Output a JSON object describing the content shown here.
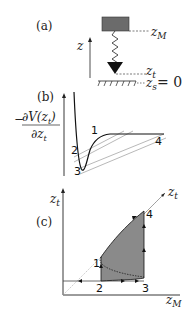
{
  "panel_a": {
    "label": "(a)",
    "axis_label": "z",
    "z_M": "z",
    "z_M_sub": "M",
    "z_t": "z",
    "z_t_sub": "t",
    "z_s": "z",
    "z_s_sub": "s",
    "z_s_eq": "= 0",
    "colors": {
      "cantilever": "#6b6b6b",
      "tip": "#111111"
    }
  },
  "panel_b": {
    "label": "(b)",
    "ylabel_num": "∂V(z",
    "ylabel_num_sub": "t",
    "ylabel_num_end": ")",
    "ylabel_den": "∂z",
    "ylabel_den_sub": "t",
    "ylabel_sign": "−",
    "points": [
      "1",
      "2",
      "3",
      "4"
    ]
  },
  "panel_c": {
    "label": "(c)",
    "y_axis": "z",
    "y_axis_sub": "t",
    "diag_label": "z",
    "diag_label_sub": "t",
    "x_axis": "z",
    "x_axis_sub": "M",
    "points": [
      "1",
      "2",
      "3",
      "4"
    ],
    "colors": {
      "hysteresis_fill": "#8a8a8a"
    }
  }
}
